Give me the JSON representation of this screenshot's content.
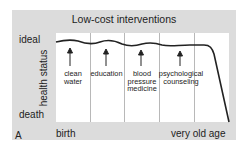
{
  "figure": {
    "panel_letter": "A",
    "title": "Low-cost interventions",
    "y_axis": {
      "title": "health status",
      "top_label": "ideal",
      "bottom_label": "death"
    },
    "x_axis": {
      "left_label": "birth",
      "right_label": "very old age"
    },
    "interventions": [
      {
        "label_line1": "clean",
        "label_line2": "water",
        "label_line3": ""
      },
      {
        "label_line1": "education",
        "label_line2": "",
        "label_line3": ""
      },
      {
        "label_line1": "blood",
        "label_line2": "pressure",
        "label_line3": "medicine"
      },
      {
        "label_line1": "psychological",
        "label_line2": "counseling",
        "label_line3": ""
      }
    ],
    "colors": {
      "panel_bg": "#dcdcdc",
      "plot_bg": "#ffffff",
      "divider": "#b8b8b8",
      "curve": "#222222"
    }
  }
}
